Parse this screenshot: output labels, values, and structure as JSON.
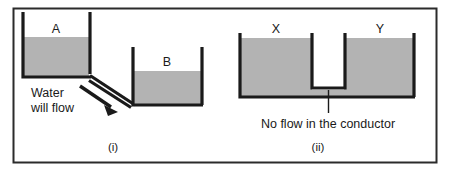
{
  "figure": {
    "border_color": "#2b2b2b",
    "background_color": "#ffffff",
    "water_fill_color": "#b3b3b3",
    "stroke_color": "#1a1a1a",
    "panels": [
      {
        "id": "panel-i",
        "caption": "(i)",
        "vessels": [
          {
            "id": "vessel-a",
            "label": "A"
          },
          {
            "id": "vessel-b",
            "label": "B"
          }
        ],
        "annotation_line_1": "Water",
        "annotation_line_2": "will flow",
        "arrow": "flow-arrow"
      },
      {
        "id": "panel-ii",
        "caption": "(ii)",
        "vessels": [
          {
            "id": "vessel-x",
            "label": "X"
          },
          {
            "id": "vessel-y",
            "label": "Y"
          }
        ],
        "annotation": "No flow in the conductor",
        "inner_vessel": "conductor"
      }
    ]
  }
}
